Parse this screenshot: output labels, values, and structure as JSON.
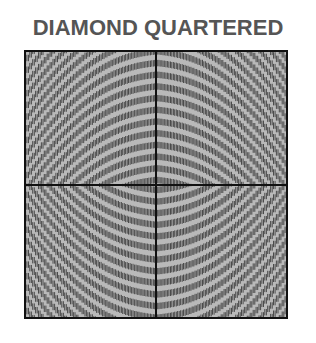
{
  "title": "DIAMOND QUARTERED",
  "figure": {
    "quadrants": [
      {
        "position": "top-left",
        "stripe_direction": "rising"
      },
      {
        "position": "top-right",
        "stripe_direction": "falling"
      },
      {
        "position": "bottom-left",
        "stripe_direction": "falling"
      },
      {
        "position": "bottom-right",
        "stripe_direction": "rising"
      }
    ],
    "colors": {
      "background": "#b9b9b9",
      "stripe": "#3e3e3e",
      "border": "#111111",
      "title": "#555555"
    }
  }
}
